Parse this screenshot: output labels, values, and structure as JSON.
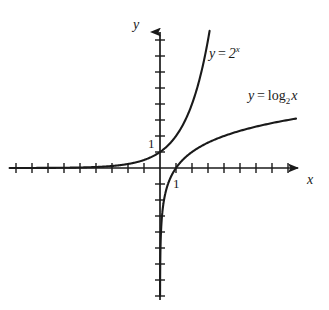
{
  "figure": {
    "background_color": "#ffffff",
    "ink_color": "#1a1a1a"
  },
  "axes": {
    "x_axis_label": "x",
    "y_axis_label": "y",
    "origin_px": [
      160,
      168
    ],
    "unit_px": 16,
    "x_tick_label": "1",
    "y_tick_label": "1",
    "x_tick_label_value": 1,
    "y_tick_label_value": 1,
    "x_range": [
      -9.4,
      9.4
    ],
    "y_range": [
      -8.6,
      9.1
    ],
    "x_ticks": [
      -9,
      -8,
      -7,
      -6,
      -5,
      -4,
      -3,
      -2,
      -1,
      1,
      2,
      3,
      4,
      5,
      6,
      7,
      8
    ],
    "y_ticks": [
      -8,
      -7,
      -6,
      -5,
      -4,
      -3,
      -2,
      -1,
      1,
      2,
      3,
      4,
      5,
      6,
      7,
      8
    ],
    "grid": false,
    "arrowheads": [
      "x-positive",
      "y-positive"
    ]
  },
  "curves": [
    {
      "id": "exponential",
      "label_text": "y = 2",
      "label_exponent": "x",
      "label_prefix": "y",
      "label_operator": "=",
      "label_body": "2",
      "function": "y = 2^x",
      "base": 2,
      "x_domain": [
        -9.4,
        3.1
      ],
      "asymptote": "y = 0",
      "passes_through": [
        [
          0,
          1
        ],
        [
          1,
          2
        ],
        [
          2,
          4
        ],
        [
          3,
          8
        ]
      ]
    },
    {
      "id": "logarithmic",
      "label_prefix": "y",
      "label_operator": "=",
      "label_fn": "log",
      "label_base": "2",
      "label_arg": "x",
      "function": "y = log_2 x",
      "base": 2,
      "x_domain": [
        0.0039,
        8.5
      ],
      "asymptote": "x = 0",
      "passes_through": [
        [
          1,
          0
        ],
        [
          2,
          1
        ],
        [
          4,
          2
        ],
        [
          8,
          3
        ]
      ]
    }
  ],
  "chart_data": {
    "type": "line",
    "title": "",
    "xlabel": "x",
    "ylabel": "y",
    "xlim": [
      -9.4,
      9.4
    ],
    "ylim": [
      -8.6,
      9.1
    ],
    "grid": false,
    "legend": "inline-annotations",
    "series": [
      {
        "name": "y = 2^x",
        "x": [
          -9,
          -8,
          -7,
          -6,
          -5,
          -4,
          -3,
          -2,
          -1,
          0,
          0.5,
          1,
          1.5,
          2,
          2.5,
          3,
          3.1
        ],
        "values": [
          0.002,
          0.004,
          0.008,
          0.016,
          0.031,
          0.063,
          0.125,
          0.25,
          0.5,
          1,
          1.414,
          2,
          2.828,
          4,
          5.657,
          8,
          8.574
        ]
      },
      {
        "name": "y = log_2 x",
        "x": [
          0.0039,
          0.0078,
          0.0156,
          0.031,
          0.063,
          0.125,
          0.25,
          0.5,
          1,
          2,
          3,
          4,
          5,
          6,
          7,
          8,
          8.5
        ],
        "values": [
          -8,
          -7,
          -6,
          -5,
          -4,
          -3,
          -2,
          -1,
          0,
          1,
          1.585,
          2,
          2.322,
          2.585,
          2.807,
          3,
          3.087
        ]
      }
    ],
    "annotations": [
      {
        "text": "y = 2^x",
        "x": 3.1,
        "y": 7.6
      },
      {
        "text": "y = log_2 x",
        "x": 5.5,
        "y": 5.0
      }
    ]
  }
}
